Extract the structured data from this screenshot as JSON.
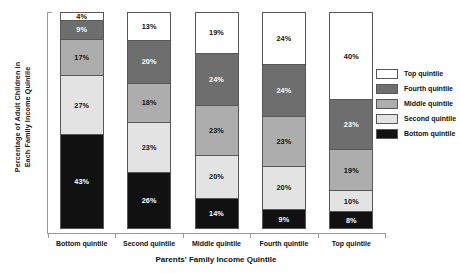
{
  "chart_data": {
    "type": "bar",
    "subtype": "stacked-bar-100",
    "title": "",
    "xlabel": "Parents' Family Income Quintile",
    "ylabel": "Percentage of Adult Children in Each Family Income Quintile",
    "ylabel_lines": [
      "Percentage of Adult Children in",
      "Each Family Income Quintile"
    ],
    "categories": [
      "Bottom quintile",
      "Second quintile",
      "Middle quintile",
      "Fourth quintile",
      "Top quintile"
    ],
    "ylim": [
      0,
      100
    ],
    "grid": false,
    "legend_position": "right",
    "stack_order_bottom_to_top": [
      "Bottom quintile",
      "Second quintile",
      "Middle quintile",
      "Fourth quintile",
      "Top quintile"
    ],
    "series": [
      {
        "name": "Top quintile",
        "color": "#ffffff",
        "values": [
          4,
          13,
          19,
          24,
          40
        ],
        "labels": [
          "4%",
          "13%",
          "19%",
          "24%",
          "40%"
        ]
      },
      {
        "name": "Fourth quintile",
        "color": "#6e6e6e",
        "values": [
          9,
          20,
          24,
          24,
          23
        ],
        "labels": [
          "9%",
          "20%",
          "24%",
          "24%",
          "23%"
        ]
      },
      {
        "name": "Middle quintile",
        "color": "#adadad",
        "values": [
          17,
          18,
          23,
          23,
          19
        ],
        "labels": [
          "17%",
          "18%",
          "23%",
          "23%",
          "19%"
        ]
      },
      {
        "name": "Second quintile",
        "color": "#e3e3e3",
        "values": [
          27,
          23,
          20,
          20,
          10
        ],
        "labels": [
          "27%",
          "23%",
          "20%",
          "20%",
          "10%"
        ]
      },
      {
        "name": "Bottom quintile",
        "color": "#111111",
        "values": [
          43,
          26,
          14,
          9,
          8
        ],
        "labels": [
          "43%",
          "26%",
          "14%",
          "9%",
          "8%"
        ]
      }
    ],
    "legend": [
      {
        "label": "Top quintile",
        "color": "#ffffff"
      },
      {
        "label": "Fourth quintile",
        "color": "#6e6e6e"
      },
      {
        "label": "Middle quintile",
        "color": "#adadad"
      },
      {
        "label": "Second quintile",
        "color": "#e3e3e3"
      },
      {
        "label": "Bottom quintile",
        "color": "#111111"
      }
    ]
  }
}
